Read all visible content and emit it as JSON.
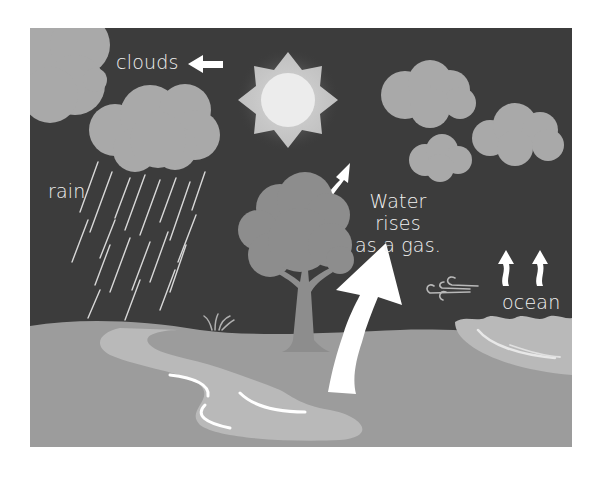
{
  "diagram": {
    "labels": {
      "clouds": "clouds",
      "rain": "rain",
      "water_rises_line1": "Water rises",
      "water_rises_line2": "as a gas.",
      "ocean": "ocean"
    },
    "elements": [
      "sun",
      "clouds",
      "rain-cloud",
      "rain-streaks",
      "tree",
      "grass",
      "river",
      "ocean",
      "wind",
      "evaporation-arrows",
      "cloud-movement-arrow"
    ],
    "colors": {
      "sky": "#3c3c3c",
      "cloud": "#a9a9a9",
      "sun_glow": "#c9c9c9",
      "sun_core": "#ececec",
      "ground": "#9c9c9c",
      "river": "#b9b9b9",
      "tree": "#8d8d8d",
      "text": "#f2f2f2",
      "arrow": "#ffffff"
    }
  }
}
